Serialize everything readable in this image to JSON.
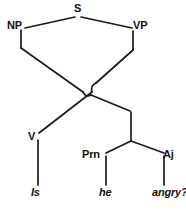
{
  "diagram": {
    "kind": "syntax-tree",
    "title": "",
    "stroke_color": "#1a1a1a",
    "background_color": "#ffffff",
    "nodes": [
      {
        "id": "s",
        "label": "S",
        "x": 78,
        "y": 14,
        "type": "phrase"
      },
      {
        "id": "np",
        "label": "NP",
        "x": 22,
        "y": 27,
        "type": "phrase"
      },
      {
        "id": "vp",
        "label": "VP",
        "x": 136,
        "y": 27,
        "type": "phrase"
      },
      {
        "id": "v",
        "label": "V",
        "x": 33,
        "y": 138,
        "type": "category"
      },
      {
        "id": "prn",
        "label": "Prn",
        "x": 94,
        "y": 155,
        "type": "category"
      },
      {
        "id": "aj",
        "label": "Aj",
        "x": 168,
        "y": 155,
        "type": "category"
      }
    ],
    "terminals": [
      {
        "id": "is",
        "label": "Is",
        "x": 36,
        "y": 190,
        "parent": "v"
      },
      {
        "id": "he",
        "label": "he",
        "x": 106,
        "y": 190,
        "parent": "prn"
      },
      {
        "id": "angry",
        "label": "angry?",
        "x": 164,
        "y": 190,
        "parent": "aj"
      }
    ],
    "sentence": "Is he angry?",
    "crossing_hops": 2
  }
}
